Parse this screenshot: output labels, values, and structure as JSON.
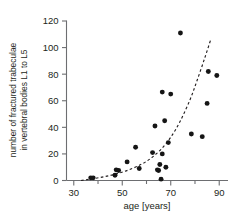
{
  "chart_data": {
    "type": "scatter",
    "title": "",
    "xlabel": "age [years]",
    "ylabel": "number of fractured trabeculae\nin vertebral bodies L1 to L5",
    "ylabel_line1": "number of fractured trabeculae",
    "ylabel_line2": "in vertebral bodies L1 to L5",
    "xlim": [
      27,
      93
    ],
    "ylim": [
      0,
      120
    ],
    "xticks": [
      30,
      50,
      70,
      90
    ],
    "xticks_minor": [
      40,
      60,
      80
    ],
    "yticks": [
      0,
      20,
      40,
      60,
      80,
      100,
      120
    ],
    "xtick_labels": [
      "30",
      "50",
      "70",
      "90"
    ],
    "ytick_labels": [
      "0",
      "20",
      "40",
      "60",
      "80",
      "100",
      "120"
    ],
    "grid": false,
    "legend": false,
    "marker": "filled-circle",
    "marker_color": "#151515",
    "points": [
      {
        "x": 37.0,
        "y": 2.0
      },
      {
        "x": 38.0,
        "y": 2.0
      },
      {
        "x": 47.0,
        "y": 4.0
      },
      {
        "x": 47.5,
        "y": 8.0
      },
      {
        "x": 48.5,
        "y": 7.5
      },
      {
        "x": 52.0,
        "y": 14.0
      },
      {
        "x": 55.5,
        "y": 25.0
      },
      {
        "x": 57.0,
        "y": 9.0
      },
      {
        "x": 62.5,
        "y": 21.0
      },
      {
        "x": 63.5,
        "y": 41.0
      },
      {
        "x": 64.5,
        "y": 8.0
      },
      {
        "x": 65.0,
        "y": 7.5
      },
      {
        "x": 65.5,
        "y": 12.0
      },
      {
        "x": 66.0,
        "y": 1.0
      },
      {
        "x": 66.5,
        "y": 20.0
      },
      {
        "x": 66.5,
        "y": 66.5
      },
      {
        "x": 67.5,
        "y": 45.0
      },
      {
        "x": 68.0,
        "y": 10.0
      },
      {
        "x": 69.0,
        "y": 28.5
      },
      {
        "x": 70.0,
        "y": 65.0
      },
      {
        "x": 74.0,
        "y": 111.0
      },
      {
        "x": 78.5,
        "y": 35.0
      },
      {
        "x": 83.0,
        "y": 33.0
      },
      {
        "x": 85.0,
        "y": 58.0
      },
      {
        "x": 85.5,
        "y": 82.0
      },
      {
        "x": 89.0,
        "y": 79.0
      }
    ],
    "fit_curve": {
      "style": "dashed",
      "color": "#231f20",
      "description": "exponential trend line",
      "points": [
        {
          "x": 33.0,
          "y": 0.0
        },
        {
          "x": 38.0,
          "y": 1.4
        },
        {
          "x": 43.0,
          "y": 3.0
        },
        {
          "x": 48.0,
          "y": 5.2
        },
        {
          "x": 53.0,
          "y": 8.2
        },
        {
          "x": 58.0,
          "y": 12.3
        },
        {
          "x": 62.0,
          "y": 17.0
        },
        {
          "x": 66.0,
          "y": 23.5
        },
        {
          "x": 70.0,
          "y": 32.5
        },
        {
          "x": 74.0,
          "y": 45.0
        },
        {
          "x": 78.0,
          "y": 61.0
        },
        {
          "x": 81.0,
          "y": 76.0
        },
        {
          "x": 84.0,
          "y": 92.0
        },
        {
          "x": 86.5,
          "y": 106.0
        }
      ]
    }
  }
}
